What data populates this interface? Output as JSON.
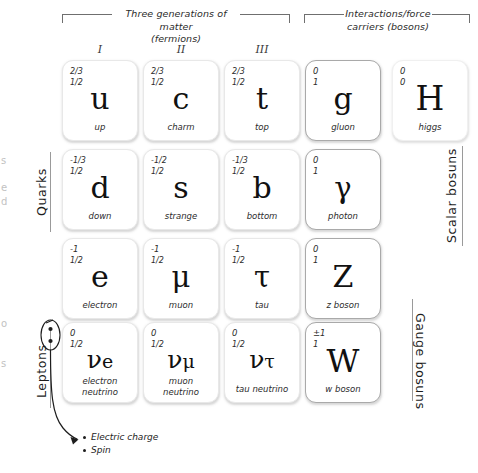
{
  "headers": {
    "fermions": "Three generations of matter\n(fermions)",
    "bosons": "Interactions/force\ncarriers (bosons)"
  },
  "generations": [
    {
      "numeral": "I"
    },
    {
      "numeral": "II"
    },
    {
      "numeral": "III"
    }
  ],
  "side_labels": {
    "quarks": "Quarks",
    "leptons": "Leptons",
    "scalar_bosons": "Scalar bosuns",
    "gauge_bosons": "Gauge bosuns"
  },
  "legend": {
    "charge": "Electric charge",
    "spin": "Spin"
  },
  "particles": {
    "up": {
      "charge": "2/3",
      "spin": "1/2",
      "symbol": "u",
      "name": "up"
    },
    "charm": {
      "charge": "2/3",
      "spin": "1/2",
      "symbol": "c",
      "name": "charm"
    },
    "top": {
      "charge": "2/3",
      "spin": "1/2",
      "symbol": "t",
      "name": "top"
    },
    "gluon": {
      "charge": "0",
      "spin": "1",
      "symbol": "g",
      "name": "gluon"
    },
    "higgs": {
      "charge": "0",
      "spin": "0",
      "symbol": "H",
      "name": "higgs"
    },
    "down": {
      "charge": "-1/3",
      "spin": "1/2",
      "symbol": "d",
      "name": "down"
    },
    "strange": {
      "charge": "-1/2",
      "spin": "1/2",
      "symbol": "s",
      "name": "strange"
    },
    "bottom": {
      "charge": "-1/3",
      "spin": "1/2",
      "symbol": "b",
      "name": "bottom"
    },
    "photon": {
      "charge": "0",
      "spin": "1",
      "symbol": "γ",
      "name": "photon"
    },
    "electron": {
      "charge": "-1",
      "spin": "1/2",
      "symbol": "e",
      "name": "electron"
    },
    "muon": {
      "charge": "-1",
      "spin": "1/2",
      "symbol": "μ",
      "name": "muon"
    },
    "tau": {
      "charge": "-1",
      "spin": "1/2",
      "symbol": "τ",
      "name": "tau"
    },
    "zboson": {
      "charge": "0",
      "spin": "1",
      "symbol": "Z",
      "name": "z boson"
    },
    "electron_neutrino": {
      "charge": "0",
      "spin": "1/2",
      "symbol": "ν",
      "sub": "e",
      "name": "electron\nneutrino"
    },
    "muon_neutrino": {
      "charge": "0",
      "spin": "1/2",
      "symbol": "ν",
      "sub": "μ",
      "name": "muon\nneutrino"
    },
    "tau_neutrino": {
      "charge": "0",
      "spin": "1/2",
      "symbol": "ν",
      "sub": "τ",
      "name": "tau neutrino"
    },
    "wboson": {
      "charge": "±1",
      "spin": "1",
      "symbol": "W",
      "name": "w boson"
    }
  },
  "colors": {
    "fermion_border": "#e8e8e8",
    "boson_border": "#a9a9a9",
    "text": "#1a1a1a",
    "rule": "#9a9a9a"
  }
}
